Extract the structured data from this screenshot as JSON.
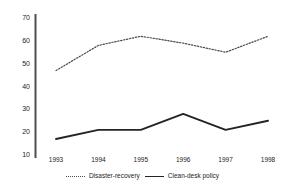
{
  "chart_data": {
    "type": "line",
    "title": "",
    "subtitle": "",
    "xlabel": "",
    "ylabel": "",
    "categories": [
      "1993",
      "1994",
      "1995",
      "1996",
      "1997",
      "1998"
    ],
    "x_tick_labels": [
      "1993",
      "1994",
      "1995",
      "1996",
      "1997",
      "1998"
    ],
    "y_tick_labels": [
      "70",
      "60",
      "50",
      "40",
      "30",
      "20",
      "10"
    ],
    "y_ticks": [
      70,
      60,
      50,
      40,
      30,
      20,
      10
    ],
    "ylim": [
      10,
      70
    ],
    "grid": false,
    "legend_position": "bottom-center",
    "series": [
      {
        "name": "Disaster-recovery",
        "style": "dotted",
        "color": "#4a4a4a",
        "values": [
          47,
          58,
          62,
          59,
          55,
          62
        ]
      },
      {
        "name": "Clean-desk policy",
        "style": "solid",
        "color": "#242424",
        "values": [
          17,
          21,
          21,
          28,
          21,
          25
        ]
      }
    ]
  },
  "axis": {
    "y_axis_color": "#4d4d4d",
    "tick_text_color": "#1c1c1c"
  },
  "legend": {
    "entries": [
      {
        "label": "Disaster-recovery",
        "swatch": "dotted-line-swatch"
      },
      {
        "label": "Clean-desk policy",
        "swatch": "solid-line-swatch"
      }
    ]
  }
}
